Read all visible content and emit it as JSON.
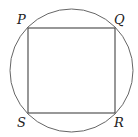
{
  "diagram": {
    "labels": {
      "P": "P",
      "Q": "Q",
      "R": "R",
      "S": "S"
    },
    "colors": {
      "stroke": "#555555",
      "background": "#ffffff"
    }
  }
}
